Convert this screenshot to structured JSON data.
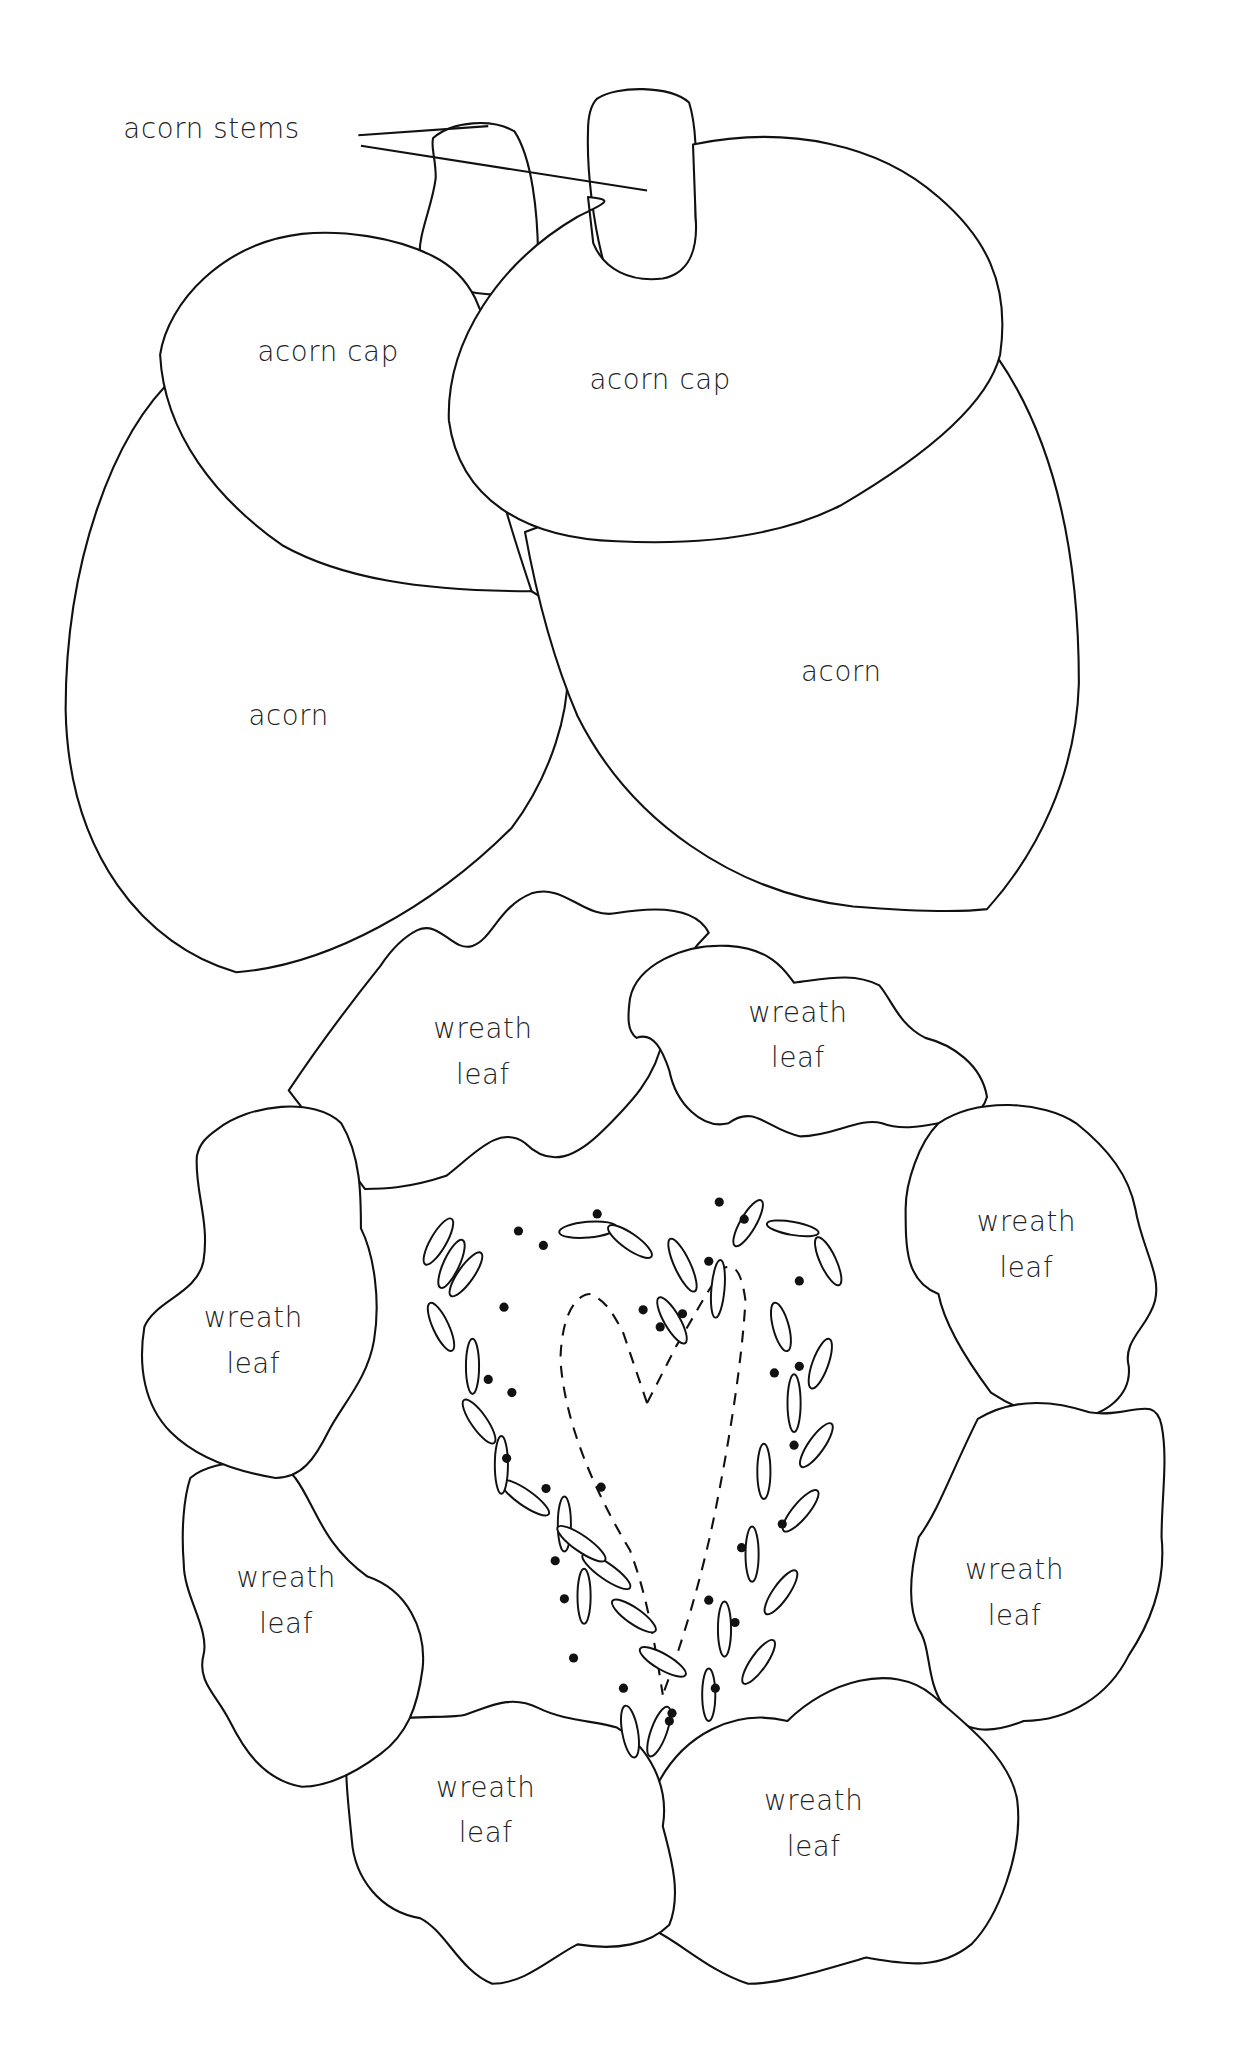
{
  "pattern": {
    "stems_label": "acorn stems",
    "acorn_caps": [
      {
        "label": "acorn cap"
      },
      {
        "label": "acorn cap"
      }
    ],
    "acorns": [
      {
        "label": "acorn"
      },
      {
        "label": "acorn"
      }
    ],
    "wreath_leaves": [
      {
        "line1": "wreath",
        "line2": "leaf"
      },
      {
        "line1": "wreath",
        "line2": "leaf"
      },
      {
        "line1": "wreath",
        "line2": "leaf"
      },
      {
        "line1": "wreath",
        "line2": "leaf"
      },
      {
        "line1": "wreath",
        "line2": "leaf"
      },
      {
        "line1": "wreath",
        "line2": "leaf"
      },
      {
        "line1": "wreath",
        "line2": "leaf"
      },
      {
        "line1": "wreath",
        "line2": "leaf"
      }
    ],
    "center_motif": "dashed-heart-with-lazy-daisy-petals-and-dots",
    "colors": {
      "line": "#111111",
      "background": "#ffffff"
    }
  }
}
